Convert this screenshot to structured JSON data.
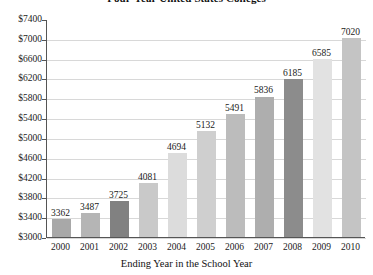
{
  "chart_data": {
    "type": "bar",
    "title": "Four-Year United States Colleges",
    "xlabel": "Ending Year in the School Year",
    "ylabel": "",
    "categories": [
      "2000",
      "2001",
      "2002",
      "2003",
      "2004",
      "2005",
      "2006",
      "2007",
      "2008",
      "2009",
      "2010"
    ],
    "values": [
      3362,
      3487,
      3725,
      4081,
      4694,
      5132,
      5491,
      5836,
      6185,
      6585,
      7020
    ],
    "bar_colors": [
      "#a8a8a8",
      "#b5b5b5",
      "#818181",
      "#c9c9c9",
      "#dcdcdc",
      "#cfcfcf",
      "#bcbcbc",
      "#aeaeae",
      "#8c8c8c",
      "#e2e2e2",
      "#c4c4c4"
    ],
    "ylim": [
      3000,
      7400
    ],
    "ytick_step": 400,
    "ytick_labels": [
      "$7400",
      "$7000",
      "$6600",
      "$6200",
      "$5800",
      "$5400",
      "$5000",
      "$4600",
      "$4200",
      "$3800",
      "$3400",
      "$3000"
    ],
    "ytick_values": [
      7400,
      7000,
      6600,
      6200,
      5800,
      5400,
      5000,
      4600,
      4200,
      3800,
      3400,
      3000
    ],
    "grid": true,
    "legend": null,
    "value_labels_shown": true
  }
}
